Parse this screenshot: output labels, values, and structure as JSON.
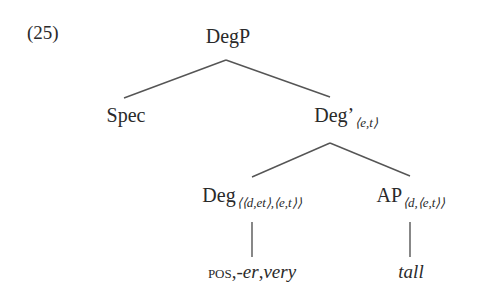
{
  "example_number": "(25)",
  "tree": {
    "root": {
      "label": "DegP"
    },
    "spec": {
      "label": "Spec"
    },
    "deg_bar": {
      "label": "Deg’",
      "type": "⟨e,t⟩"
    },
    "deg_head": {
      "label": "Deg",
      "type": "⟨⟨d,et⟩,⟨e,t⟩⟩"
    },
    "ap": {
      "label": "AP",
      "type": "⟨d,⟨e,t⟩⟩"
    },
    "deg_leaf": {
      "pos": "pos",
      "sep1": ",",
      "er": "-er",
      "sep2": ",",
      "very": "very"
    },
    "ap_leaf": {
      "label": "tall"
    }
  },
  "colors": {
    "text": "#2a2a2a",
    "edges": "#555555",
    "background": "#ffffff"
  }
}
